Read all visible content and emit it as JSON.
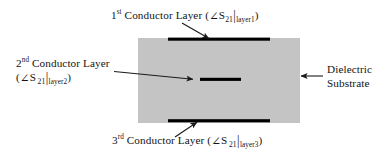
{
  "figure": {
    "background_color": "#ffffff"
  },
  "substrate": {
    "name": "Dielectric Substrate",
    "fill_color": "#c4c4c4",
    "x": 138,
    "y": 38,
    "width": 162,
    "height": 85
  },
  "conductors": [
    {
      "id": "layer1",
      "ordinal": "1",
      "ordinal_suffix": "st",
      "name": "Conductor Layer",
      "parameter": "S",
      "parameter_subscript": "21",
      "condition_subscript": "layer1",
      "color": "#000000",
      "x": 168,
      "y": 38,
      "width": 102,
      "height": 3
    },
    {
      "id": "layer2",
      "ordinal": "2",
      "ordinal_suffix": "nd",
      "name": "Conductor Layer",
      "parameter": "S",
      "parameter_subscript": "21",
      "condition_subscript": "layer2",
      "color": "#000000",
      "x": 200,
      "y": 78,
      "width": 41,
      "height": 3
    },
    {
      "id": "layer3",
      "ordinal": "3",
      "ordinal_suffix": "rd",
      "name": "Conductor Layer",
      "parameter": "S",
      "parameter_subscript": "21",
      "condition_subscript": "layer3",
      "color": "#000000",
      "x": 168,
      "y": 119,
      "width": 102,
      "height": 3
    }
  ],
  "labels": {
    "top": {
      "ordinal": "1",
      "suffix": "st",
      "text": "Conductor Layer",
      "open_paren": "(",
      "angle": "∠",
      "symbol": "S",
      "symbol_sub": "21",
      "pipe": "|",
      "condition": "layer1",
      "close_paren": ")"
    },
    "left": {
      "ordinal": "2",
      "suffix": "nd",
      "text": "Conductor Layer",
      "open_paren": "(",
      "angle": "∠",
      "symbol": "S",
      "symbol_sub": "21",
      "pipe": "|",
      "condition": "layer2",
      "close_paren": ")"
    },
    "bottom": {
      "ordinal": "3",
      "suffix": "rd",
      "text": "Conductor Layer",
      "open_paren": "(",
      "angle": "∠",
      "symbol": "S",
      "symbol_sub": "21",
      "pipe": "|",
      "condition": "layer3",
      "close_paren": ")"
    },
    "right": {
      "line1": "Dielectric",
      "line2": "Substrate"
    }
  },
  "leaders": [
    {
      "id": "leader-top",
      "from_label": "top",
      "to_conductor": "layer1",
      "x1": 182,
      "y1": 23,
      "x2": 209,
      "y2": 39
    },
    {
      "id": "leader-left",
      "from_label": "left",
      "to_conductor": "layer2",
      "x1": 114,
      "y1": 72,
      "x2": 193,
      "y2": 79
    },
    {
      "id": "leader-bottom",
      "from_label": "bottom",
      "to_conductor": "layer3",
      "x1": 175,
      "y1": 137,
      "x2": 197,
      "y2": 122
    },
    {
      "id": "leader-right",
      "from_label": "right",
      "to_target": "substrate",
      "x1": 323,
      "y1": 76,
      "x2": 300,
      "y2": 76
    }
  ],
  "colors": {
    "substrate_gray": "#c4c4c4",
    "conductor_black": "#000000",
    "text": "#141414",
    "leader_line": "#1a1a1a"
  }
}
